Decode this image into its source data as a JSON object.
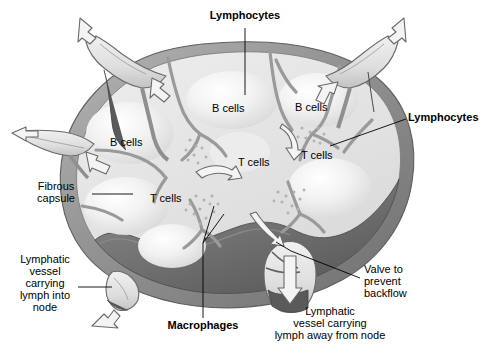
{
  "figure": {
    "domain": "anatomical-diagram",
    "canvas": {
      "width": 484,
      "height": 355,
      "background": "#ffffff"
    }
  },
  "palette": {
    "capsule_outer": "#8d8d8d",
    "capsule_inner_light": "#c9c9c9",
    "cortex_fill": "#e4e4e4",
    "follicle_highlight": "#ffffff",
    "medulla_shadow": "#6f6f6f",
    "medulla_dark": "#5a5a5a",
    "trabecula": "#9a9a9a",
    "vessel_fill": "#e8e8e8",
    "vessel_dark": "#585858",
    "dot_color": "#b0b0b0",
    "arrow_outline": "#6a6a6a",
    "text": "#000000",
    "leader_line": "#000000"
  },
  "labels": {
    "lymphocytes_top": {
      "text": "Lymphocytes",
      "bold": true,
      "x": 200,
      "y": 12,
      "width": 90,
      "font_size": 11,
      "align": "center",
      "leader": {
        "type": "vertical",
        "x": 245,
        "y1": 27,
        "y2": 95
      }
    },
    "lymphocytes_right": {
      "text": "Lymphocytes",
      "bold": true,
      "x": 408,
      "y": 110,
      "width": 76,
      "font_size": 11,
      "align": "left",
      "leader": {
        "type": "diagonal",
        "x1": 406,
        "y1": 119,
        "x2": 330,
        "y2": 146
      }
    },
    "fibrous_capsule": {
      "text": "Fibrous\ncapsule",
      "bold": false,
      "x": 22,
      "y": 182,
      "width": 66,
      "font_size": 11,
      "align": "left",
      "leader": {
        "type": "horizontal",
        "x1": 92,
        "y1": 194,
        "x2": 133,
        "y2": 194
      }
    },
    "vessel_into_node": {
      "text": "Lymphatic\nvessel\ncarrying\nlymph into\nnode",
      "bold": false,
      "x": 14,
      "y": 255,
      "width": 76,
      "font_size": 11,
      "align": "center",
      "leader": {
        "type": "horizontal",
        "x1": 78,
        "y1": 287,
        "x2": 112,
        "y2": 287
      }
    },
    "macrophages": {
      "text": "Macrophages",
      "bold": true,
      "x": 160,
      "y": 320,
      "width": 84,
      "font_size": 11,
      "align": "center",
      "leader": {
        "type": "vertical",
        "x1": 203,
        "y1": 318,
        "x2": 203,
        "y2": 243
      },
      "fan": [
        {
          "x1": 203,
          "y1": 243,
          "x2": 222,
          "y2": 215
        },
        {
          "x1": 203,
          "y1": 243,
          "x2": 214,
          "y2": 208
        }
      ]
    },
    "vessel_away_from_node": {
      "text": "Lymphatic\nvessel carrying\nlymph away from node",
      "bold": false,
      "x": 262,
      "y": 305,
      "width": 134,
      "font_size": 11,
      "align": "center"
    },
    "valve": {
      "text": "Valve to\nprevent\nbackflow",
      "bold": false,
      "x": 362,
      "y": 266,
      "width": 68,
      "font_size": 11,
      "align": "left",
      "leader": {
        "type": "diagonal",
        "x1": 360,
        "y1": 278,
        "x2": 291,
        "y2": 251
      }
    }
  },
  "regions": [
    {
      "name": "b-cells-left",
      "text": "B cells",
      "x": 110,
      "y": 137,
      "font_size": 11
    },
    {
      "name": "b-cells-center",
      "text": "B cells",
      "x": 212,
      "y": 104,
      "font_size": 11
    },
    {
      "name": "b-cells-right",
      "text": "B cells",
      "x": 293,
      "y": 103,
      "font_size": 11
    },
    {
      "name": "t-cells-center",
      "text": "T cells",
      "x": 236,
      "y": 157,
      "font_size": 11
    },
    {
      "name": "t-cells-right",
      "text": "T cells",
      "x": 300,
      "y": 150,
      "font_size": 11
    },
    {
      "name": "t-cells-lower-left",
      "text": "T cells",
      "x": 148,
      "y": 193,
      "font_size": 11
    }
  ],
  "structures": [
    {
      "name": "fibrous-capsule",
      "description": "Outer gray connective-tissue shell enclosing the node"
    },
    {
      "name": "cortex",
      "description": "Pale outer region containing follicles of B cells"
    },
    {
      "name": "medulla",
      "description": "Darker cut-away interior below the cortex"
    },
    {
      "name": "trabeculae",
      "description": "Gray branching partitions extending inward from the capsule"
    },
    {
      "name": "afferent-vessel-top-left",
      "description": "Lymphatic vessel carrying lymph into the node"
    },
    {
      "name": "afferent-vessel-left",
      "description": "Lymphatic vessel carrying lymph into the node"
    },
    {
      "name": "afferent-vessel-top-right",
      "description": "Lymphatic vessel carrying lymph into the node"
    },
    {
      "name": "afferent-vessel-bottom-left",
      "description": "Lymphatic vessel carrying lymph into the node"
    },
    {
      "name": "efferent-vessel-bottom-right",
      "description": "Lymphatic vessel carrying lymph away from the node"
    },
    {
      "name": "valve",
      "description": "Flap valve inside the efferent vessel preventing backflow"
    },
    {
      "name": "macrophage-stipple",
      "description": "Clusters of small dots along sinuses representing macrophages"
    }
  ],
  "flow_arrows": [
    {
      "name": "inflow-arrow-top-left",
      "direction": "into-node",
      "style": "outline"
    },
    {
      "name": "inflow-arrow-left",
      "direction": "into-node",
      "style": "outline"
    },
    {
      "name": "inflow-arrow-top-right",
      "direction": "into-node",
      "style": "outline"
    },
    {
      "name": "inflow-arrow-bottom-left",
      "direction": "into-node",
      "style": "outline"
    },
    {
      "name": "internal-arrow-upper-left",
      "direction": "through-sinus",
      "style": "outline"
    },
    {
      "name": "internal-arrow-left",
      "direction": "through-sinus",
      "style": "outline"
    },
    {
      "name": "internal-arrow-center",
      "direction": "through-sinus",
      "style": "outline"
    },
    {
      "name": "internal-arrow-right",
      "direction": "through-sinus",
      "style": "outline"
    },
    {
      "name": "internal-arrow-lower",
      "direction": "through-sinus",
      "style": "outline"
    },
    {
      "name": "outflow-arrow-efferent",
      "direction": "away-from-node",
      "style": "outline"
    }
  ]
}
